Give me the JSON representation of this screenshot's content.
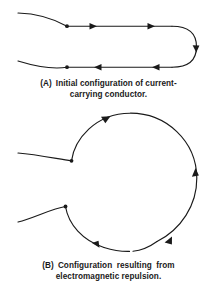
{
  "figure": {
    "background_color": "#ffffff",
    "ink_color": "#1a1a1a",
    "panels": [
      {
        "id": "A",
        "label": "(A)",
        "caption_line_1": "Initial configuration of current-",
        "caption_line_2": "carrying conductor.",
        "caption_full": "(A) Initial configuration of current-carrying conductor.",
        "description": "Two parallel straight conductors joined at right by a U-turn bend; leads curve away to the left.",
        "current_direction_top": "rightward",
        "current_direction_bottom": "leftward",
        "arrow_count": 5,
        "node_count": 2
      },
      {
        "id": "B",
        "label": "(B)",
        "caption_line_1": "Configuration resulting from",
        "caption_line_2": "electromagnetic repulsion.",
        "caption_full": "(B) Configuration resulting from electromagnetic repulsion.",
        "description": "The conductor has bowed outward into a near-circular loop driven apart by electromagnetic repulsion.",
        "current_direction": "counterclockwise",
        "arrow_count": 5,
        "node_count": 2
      }
    ]
  }
}
